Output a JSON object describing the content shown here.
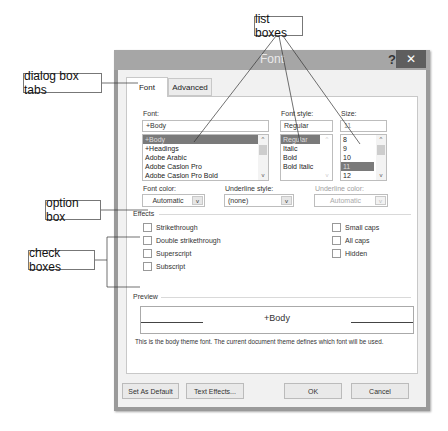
{
  "callouts": {
    "list_boxes": "list boxes",
    "dialog_tabs": "dialog box tabs",
    "option_box": "option box",
    "check_boxes": "check boxes"
  },
  "dialog": {
    "title": "Font",
    "help_glyph": "?",
    "close_glyph": "✕",
    "tabs": [
      {
        "label": "Font",
        "active": true
      },
      {
        "label": "Advanced",
        "active": false
      }
    ],
    "font": {
      "label": "Font:",
      "value": "+Body",
      "options": [
        "+Body",
        "+Headings",
        "Adobe Arabic",
        "Adobe Caslon Pro",
        "Adobe Caslon Pro Bold"
      ],
      "selected": "+Body"
    },
    "font_style": {
      "label": "Font style:",
      "value": "Regular",
      "options": [
        "Regular",
        "Italic",
        "Bold",
        "Bold Italic"
      ],
      "selected": "Regular"
    },
    "size": {
      "label": "Size:",
      "value": "11",
      "options": [
        "8",
        "9",
        "10",
        "11",
        "12"
      ],
      "selected": "11"
    },
    "font_color": {
      "label": "Font color:",
      "value": "Automatic"
    },
    "underline_style": {
      "label": "Underline style:",
      "value": "(none)"
    },
    "underline_color": {
      "label": "Underline color:",
      "value": "Automatic",
      "disabled": true
    },
    "effects": {
      "label": "Effects",
      "left": [
        "Strikethrough",
        "Double strikethrough",
        "Superscript",
        "Subscript"
      ],
      "right": [
        "Small caps",
        "All caps",
        "Hidden"
      ]
    },
    "preview": {
      "label": "Preview",
      "sample": "+Body",
      "description": "This is the body theme font. The current document theme defines which font will be used."
    },
    "buttons": {
      "set_default": "Set As Default",
      "text_effects": "Text Effects...",
      "ok": "OK",
      "cancel": "Cancel"
    },
    "icons": {
      "scroll_up": "^",
      "scroll_down": "v",
      "dropdown": "v"
    }
  }
}
